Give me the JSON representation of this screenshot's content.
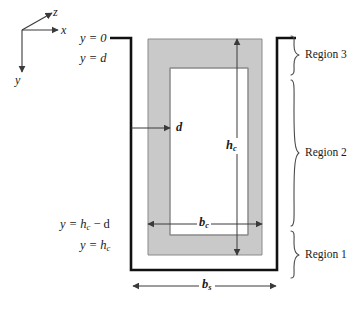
{
  "figure": {
    "colors": {
      "core_fill": "#c9c9c9",
      "core_stroke": "#8a8a8a",
      "channel_stroke": "#111111",
      "void_fill": "#ffffff",
      "text": "#1a1a1a",
      "dimension_line": "#3a3a3a",
      "brace": "#4a4a4a",
      "background": "#ffffff"
    }
  },
  "axes": {
    "label_z": "z",
    "label_x": "x",
    "label_y": "y"
  },
  "position_labels": {
    "top": "y = 0",
    "top_inner": "y = d",
    "bottom_inner_prefix": "y = h",
    "bottom_inner_sub": "c",
    "bottom_inner_suffix": " − d",
    "bottom_prefix": "y = h",
    "bottom_sub": "c"
  },
  "dimensions": {
    "thickness": "d",
    "core_height_symbol": "h",
    "core_height_sub": "c",
    "core_width_symbol": "b",
    "core_width_sub": "c",
    "overall_width_symbol": "b",
    "overall_width_sub": "s"
  },
  "regions": [
    {
      "label": "Region 3"
    },
    {
      "label": "Region 2"
    },
    {
      "label": "Region 1"
    }
  ]
}
